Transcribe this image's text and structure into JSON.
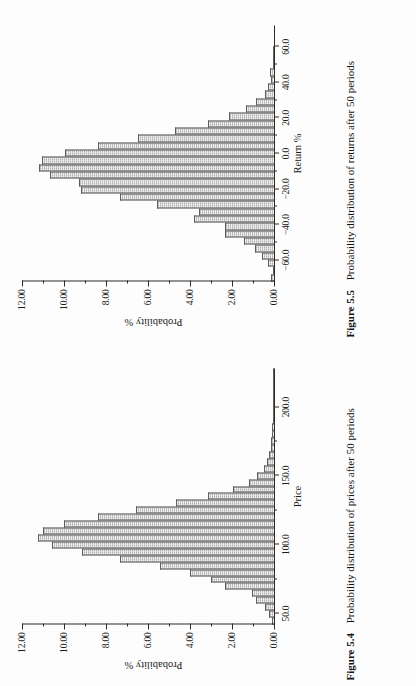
{
  "page": {
    "orientation_note": "rotated-90-ccw-book-page"
  },
  "figures": [
    {
      "id": "figure-5-5",
      "caption_number": "Figure 5.5",
      "caption_text": "Probability distribution of returns after 50 periods",
      "chart_data": {
        "type": "bar",
        "title": "",
        "subtitle": "",
        "xlabel": "Return %",
        "ylabel": "Probability %",
        "xtick_labels": [
          "−60.0",
          "−40.0",
          "−20.0",
          "0.0",
          "20.0",
          "40.0",
          "60.0"
        ],
        "xtick_values": [
          -60.0,
          -40.0,
          -20.0,
          0.0,
          20.0,
          40.0,
          60.0
        ],
        "ytick_labels": [
          "0.00",
          "2.00",
          "4.00",
          "6.00",
          "8.00",
          "10.00",
          "12.00"
        ],
        "ytick_values": [
          0.0,
          2.0,
          4.0,
          6.0,
          8.0,
          10.0,
          12.0
        ],
        "ylim": [
          0,
          12
        ],
        "xlim": [
          -72,
          72
        ],
        "grid": false,
        "legend": "none",
        "minor_ticks": true,
        "categories": [
          "-70",
          "-66",
          "-62",
          "-58",
          "-54",
          "-50",
          "-46",
          "-42",
          "-38",
          "-34",
          "-30",
          "-26",
          "-22",
          "-18",
          "-14",
          "-10",
          "-6",
          "-2",
          "2",
          "6",
          "10",
          "14",
          "18",
          "22",
          "26",
          "30",
          "34",
          "38",
          "42",
          "46",
          "50",
          "54",
          "58",
          "62",
          "66",
          "70"
        ],
        "values": [
          0.12,
          0.05,
          0.3,
          0.55,
          0.9,
          1.45,
          2.35,
          2.35,
          3.8,
          3.55,
          5.55,
          7.35,
          9.2,
          9.3,
          10.65,
          11.2,
          11.05,
          9.95,
          8.4,
          6.5,
          4.7,
          3.15,
          2.15,
          1.35,
          0.85,
          0.45,
          0.3,
          0.12,
          0.18,
          0.05,
          0.02,
          0.01,
          0.0,
          0.0,
          0.0,
          0.0
        ]
      }
    },
    {
      "id": "figure-5-4",
      "caption_number": "Figure 5.4",
      "caption_text": "Probability distribution of prices after 50 periods",
      "chart_data": {
        "type": "bar",
        "title": "",
        "subtitle": "",
        "xlabel": "Price",
        "ylabel": "Probability %",
        "xtick_labels": [
          "50.0",
          "100.0",
          "150.0",
          "200.0"
        ],
        "xtick_values": [
          50.0,
          100.0,
          150.0,
          200.0
        ],
        "ytick_labels": [
          "0.00",
          "2.00",
          "4.00",
          "6.00",
          "8.00",
          "10.00",
          "12.00"
        ],
        "ytick_values": [
          0.0,
          2.0,
          4.0,
          6.0,
          8.0,
          10.0,
          12.0
        ],
        "ylim": [
          0,
          12
        ],
        "xlim": [
          42,
          228
        ],
        "grid": false,
        "legend": "none",
        "minor_ticks": true,
        "categories": [
          "45",
          "50",
          "55",
          "60",
          "65",
          "70",
          "75",
          "80",
          "85",
          "90",
          "95",
          "100",
          "105",
          "110",
          "115",
          "120",
          "125",
          "130",
          "135",
          "140",
          "145",
          "150",
          "155",
          "160",
          "165",
          "170",
          "175",
          "180",
          "185",
          "190",
          "195",
          "200",
          "205",
          "210",
          "215",
          "220",
          "225"
        ],
        "values": [
          0.1,
          0.22,
          0.45,
          0.85,
          1.05,
          2.35,
          3.0,
          4.0,
          5.45,
          7.35,
          9.15,
          10.55,
          11.25,
          11.0,
          10.0,
          8.4,
          6.55,
          4.65,
          3.15,
          1.95,
          1.2,
          0.8,
          0.5,
          0.35,
          0.22,
          0.15,
          0.12,
          0.1,
          0.08,
          0.05,
          0.05,
          0.04,
          0.03,
          0.02,
          0.02,
          0.01,
          0.01
        ]
      }
    }
  ]
}
